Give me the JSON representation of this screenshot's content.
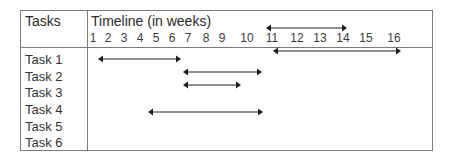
{
  "header": {
    "tasks_label": "Tasks",
    "timeline_label": "Timeline (in weeks)"
  },
  "weeks": [
    {
      "label": "1",
      "x": 93
    },
    {
      "label": "2",
      "x": 108
    },
    {
      "label": "3",
      "x": 124
    },
    {
      "label": "4",
      "x": 140
    },
    {
      "label": "5",
      "x": 156
    },
    {
      "label": "6",
      "x": 172
    },
    {
      "label": "7",
      "x": 188
    },
    {
      "label": "8",
      "x": 206
    },
    {
      "label": "9",
      "x": 222
    },
    {
      "label": "10",
      "x": 247
    },
    {
      "label": "11",
      "x": 272
    },
    {
      "label": "12",
      "x": 297
    },
    {
      "label": "13",
      "x": 320
    },
    {
      "label": "14",
      "x": 343
    },
    {
      "label": "15",
      "x": 366
    },
    {
      "label": "16",
      "x": 394
    }
  ],
  "tasks": [
    {
      "label": "Task 1",
      "y": 59
    },
    {
      "label": "Task 2",
      "y": 76
    },
    {
      "label": "Task 3",
      "y": 92
    },
    {
      "label": "Task 4",
      "y": 109
    },
    {
      "label": "Task 5",
      "y": 126
    },
    {
      "label": "Task 6",
      "y": 142
    }
  ],
  "arrows": [
    {
      "name": "arrow-header-week-11-14",
      "x1": 266,
      "x2": 347,
      "y": 28
    },
    {
      "name": "arrow-week-11-16",
      "x1": 273,
      "x2": 401,
      "y": 51
    },
    {
      "name": "arrow-task-1",
      "x1": 98,
      "x2": 181,
      "y": 59
    },
    {
      "name": "arrow-task-2",
      "x1": 183,
      "x2": 262,
      "y": 72
    },
    {
      "name": "arrow-task-3",
      "x1": 183,
      "x2": 241,
      "y": 85
    },
    {
      "name": "arrow-task-4",
      "x1": 148,
      "x2": 263,
      "y": 112
    }
  ],
  "colors": {
    "border": "#7a7a7a",
    "text": "#2a2a2a",
    "arrow": "#1e1e1e"
  }
}
